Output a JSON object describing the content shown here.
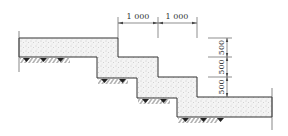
{
  "diagram": {
    "colors": {
      "line": "#333333",
      "fill": "#f3f3f3",
      "dots": "#9a9a9a",
      "text": "#333333"
    },
    "horizontal_dims": [
      {
        "label": "1 000",
        "x1": 118,
        "x2": 158
      },
      {
        "label": "1 000",
        "x1": 158,
        "x2": 197
      }
    ],
    "vertical_dims": [
      {
        "label": "500",
        "y1": 38,
        "y2": 57
      },
      {
        "label": "500",
        "y1": 57,
        "y2": 77
      },
      {
        "label": "500",
        "y1": 77,
        "y2": 97
      }
    ]
  }
}
